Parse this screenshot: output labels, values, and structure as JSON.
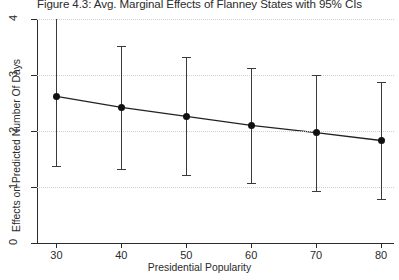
{
  "figure": {
    "title": "Figure 4.3: Avg. Marginal Effects of Flanney States with 95% CIs"
  },
  "chart_data": {
    "type": "line",
    "title": "Figure 4.3: Avg. Marginal Effects of Flanney States with 95% CIs",
    "xlabel": "Presidential Popularity",
    "ylabel": "Effects on Predicted Number Of Days",
    "xlim": [
      27,
      82
    ],
    "ylim": [
      0,
      4
    ],
    "xticks": [
      30,
      40,
      50,
      60,
      70,
      80
    ],
    "yticks": [
      0,
      1,
      2,
      3,
      4
    ],
    "xtick_labels": [
      "30",
      "40",
      "50",
      "60",
      "70",
      "80"
    ],
    "ytick_labels": [
      "0",
      "1",
      "2",
      "3",
      "4"
    ],
    "grid": "horizontal-dotted",
    "legend": "none",
    "marker": "filled-circle",
    "errorbar_style": "capped-vertical",
    "confidence_level": "95%",
    "x": [
      30,
      40,
      50,
      60,
      70,
      80
    ],
    "values": [
      2.62,
      2.42,
      2.26,
      2.1,
      1.97,
      1.83
    ],
    "ci_lower": [
      1.38,
      1.32,
      1.21,
      1.07,
      0.93,
      0.78
    ],
    "ci_upper": [
      4.08,
      3.52,
      3.33,
      3.13,
      3.0,
      2.88
    ],
    "series": [
      {
        "name": "Avg. Marginal Effect",
        "values": [
          2.62,
          2.42,
          2.26,
          2.1,
          1.97,
          1.83
        ]
      }
    ],
    "colors": {
      "line": "#222222",
      "marker": "#111111",
      "errorbar": "#3a3a3a",
      "grid": "#cfcfcf",
      "axis": "#2b2b2b",
      "background": "#ffffff"
    }
  }
}
